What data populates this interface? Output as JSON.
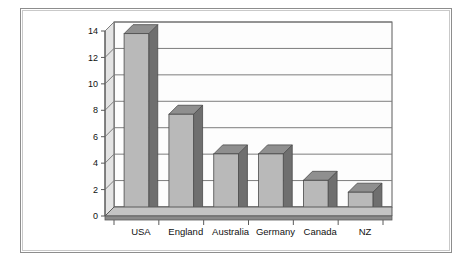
{
  "chart_data": {
    "type": "bar",
    "title": "",
    "subtitle": "",
    "xlabel": "",
    "ylabel": "",
    "categories": [
      "USA",
      "England",
      "Australia",
      "Germany",
      "Canada",
      "NZ"
    ],
    "values": [
      13.8,
      7.7,
      4.7,
      4.7,
      2.7,
      1.8
    ],
    "series": [
      {
        "name": "",
        "values": [
          13.8,
          7.7,
          4.7,
          4.7,
          2.7,
          1.8
        ]
      }
    ],
    "ylim": [
      0,
      14
    ],
    "ytick_labels": [
      "0",
      "2",
      "4",
      "6",
      "8",
      "10",
      "12",
      "14"
    ],
    "ytick_values": [
      0,
      2,
      4,
      6,
      8,
      10,
      12,
      14
    ],
    "grid": true,
    "grid_axis": "y",
    "legend": false,
    "legend_position": "none",
    "style": "3d",
    "annotations": []
  },
  "colors": {
    "bar_front": "#b9b9b9",
    "bar_side": "#6f6f6f",
    "bar_top": "#8f8f8f",
    "grid_line": "#7d7d7d",
    "axis_line": "#5a5a5a",
    "floor_front": "#8a8a8a",
    "floor_top": "#c4c4c4",
    "wall_face": "#fdfdfd",
    "wall_side": "#e3e3e3",
    "frame_outer": "#8d8d8d",
    "frame_inner": "#c9c9c9",
    "background": "#ffffff",
    "text": "#111111"
  },
  "frame": {
    "label": "chart-image-frame"
  }
}
